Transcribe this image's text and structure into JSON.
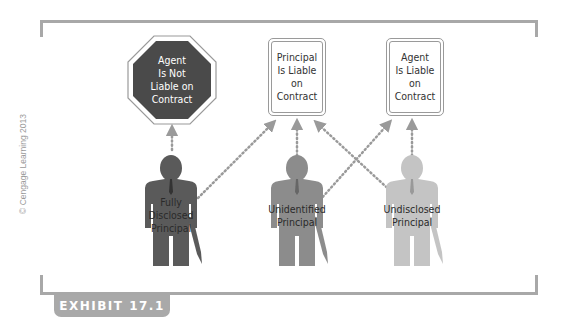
{
  "exhibit": {
    "label": "EXHIBIT 17.1"
  },
  "copyright": "© Cengage Learning 2013",
  "outcomes": [
    {
      "id": "agent-not-liable",
      "shape": "octagon",
      "lines": [
        "Agent",
        "Is Not",
        "Liable on",
        "Contract"
      ],
      "fill": "#4a4a4a"
    },
    {
      "id": "principal-liable",
      "shape": "rounded-box",
      "lines": [
        "Principal",
        "Is Liable",
        "on",
        "Contract"
      ]
    },
    {
      "id": "agent-liable",
      "shape": "rounded-box",
      "lines": [
        "Agent",
        "Is Liable",
        "on",
        "Contract"
      ]
    }
  ],
  "principals": [
    {
      "id": "fully-disclosed",
      "lines": [
        "Fully",
        "Disclosed",
        "Principal"
      ],
      "color": "#5a5a5a",
      "arrows_to": [
        "agent-not-liable",
        "principal-liable"
      ]
    },
    {
      "id": "unidentified",
      "lines": [
        "Unidentified",
        "Principal"
      ],
      "color": "#8c8c8c",
      "arrows_to": [
        "principal-liable",
        "agent-liable"
      ]
    },
    {
      "id": "undisclosed",
      "lines": [
        "Undisclosed",
        "Principal"
      ],
      "color": "#c4c4c4",
      "arrows_to": [
        "principal-liable",
        "agent-liable"
      ]
    }
  ],
  "colors": {
    "frame": "#a8a8a8",
    "arrow": "#9a9a9a"
  }
}
